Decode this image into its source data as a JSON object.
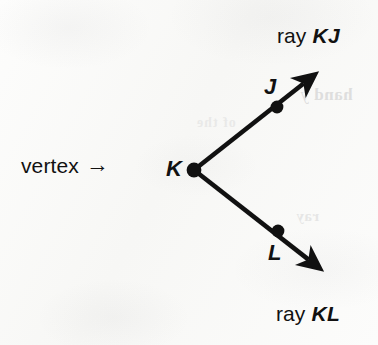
{
  "figure": {
    "kind": "geometry-diagram",
    "background_color": "#fbfbfa",
    "ink_color": "#111111"
  },
  "annotations": {
    "ray_kj": {
      "prefix": "ray",
      "name": "KJ"
    },
    "ray_kl": {
      "prefix": "ray",
      "name": "KL"
    },
    "vertex": {
      "text": "vertex",
      "arrow_glyph": "→"
    }
  },
  "points": [
    {
      "id": "K",
      "label": "K",
      "role": "vertex",
      "x": 194,
      "y": 170
    },
    {
      "id": "J",
      "label": "J",
      "role": "ray-point",
      "x": 277,
      "y": 107
    },
    {
      "id": "L",
      "label": "L",
      "role": "ray-point",
      "x": 278,
      "y": 231
    }
  ],
  "rays": [
    {
      "id": "KJ",
      "from": "K",
      "through": "J",
      "tip_x": 313,
      "tip_y": 76
    },
    {
      "id": "KL",
      "from": "K",
      "through": "L",
      "tip_x": 318,
      "tip_y": 267
    }
  ],
  "bleed_through": {
    "right_upper": "hand y",
    "right_mid": "ray",
    "center": "of the"
  }
}
